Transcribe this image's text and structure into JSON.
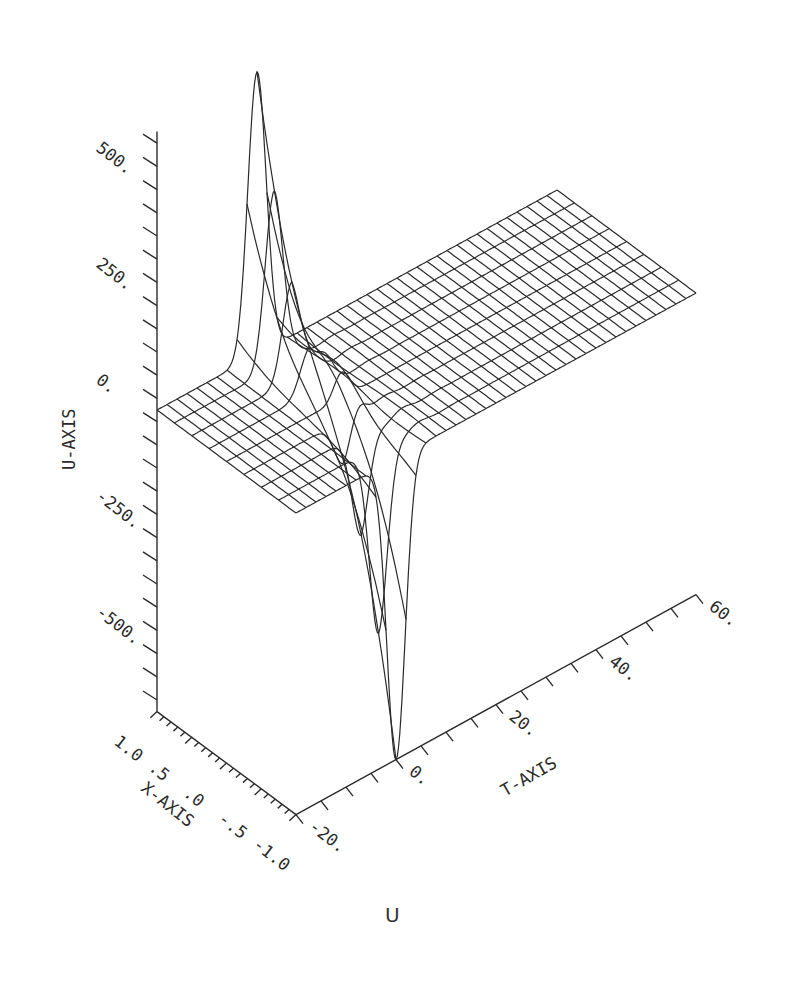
{
  "chart_data": {
    "type": "surface3d",
    "title": "",
    "caption": "U",
    "axes": {
      "u": {
        "label": "U-AXIS",
        "ticks": [
          -500,
          -250,
          0,
          250,
          500
        ],
        "tick_labels": [
          "-500.",
          "-250.",
          "0.",
          "250.",
          "500."
        ],
        "range": [
          -650,
          600
        ]
      },
      "x": {
        "label": "X-AXIS",
        "ticks": [
          1.0,
          0.5,
          0.0,
          -0.5,
          -1.0
        ],
        "tick_labels": [
          "1.0",
          ".5",
          ".0",
          "-.5",
          "-1.0"
        ],
        "range": [
          -1.0,
          1.0
        ]
      },
      "t": {
        "label": "T-AXIS",
        "ticks": [
          -20,
          0,
          20,
          40,
          60
        ],
        "tick_labels": [
          "-20.",
          "0.",
          "20.",
          "40.",
          "60."
        ],
        "range": [
          -20,
          60
        ]
      }
    },
    "surface": {
      "description": "Wireframe surface U(x,t): flat plateau at U=0 away from t≈0; a sharp positive peak (~610) near x=1.0, t≈0 and a sharp negative trough (~-650) near x=-1.0, t≈0, with small oscillations trailing for t>0.",
      "x_grid_lines": 9,
      "t_grid_lines": 41,
      "peak": {
        "x": 1.0,
        "t": 0,
        "u": 610
      },
      "trough": {
        "x": -1.0,
        "t": 0,
        "u": -650
      }
    },
    "grid": false
  },
  "figure": {
    "caption": "U"
  }
}
